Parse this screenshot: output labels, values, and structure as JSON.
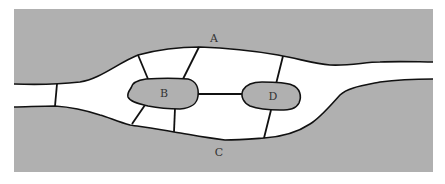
{
  "diagram": {
    "type": "konigsberg-bridges-map",
    "colors": {
      "land": "#b0b0b0",
      "water": "#ffffff",
      "line": "#111111",
      "label": "#333333"
    },
    "regions": [
      {
        "id": "A",
        "label": "A",
        "kind": "north-bank"
      },
      {
        "id": "B",
        "label": "B",
        "kind": "island"
      },
      {
        "id": "C",
        "label": "C",
        "kind": "south-bank"
      },
      {
        "id": "D",
        "label": "D",
        "kind": "island"
      }
    ],
    "bridges": [
      {
        "from": "A",
        "to": "C",
        "note": "left river branch"
      },
      {
        "from": "A",
        "to": "B"
      },
      {
        "from": "A",
        "to": "B"
      },
      {
        "from": "B",
        "to": "C"
      },
      {
        "from": "B",
        "to": "C"
      },
      {
        "from": "B",
        "to": "D"
      },
      {
        "from": "A",
        "to": "D"
      },
      {
        "from": "C",
        "to": "D"
      }
    ],
    "bridge_count": 8
  }
}
